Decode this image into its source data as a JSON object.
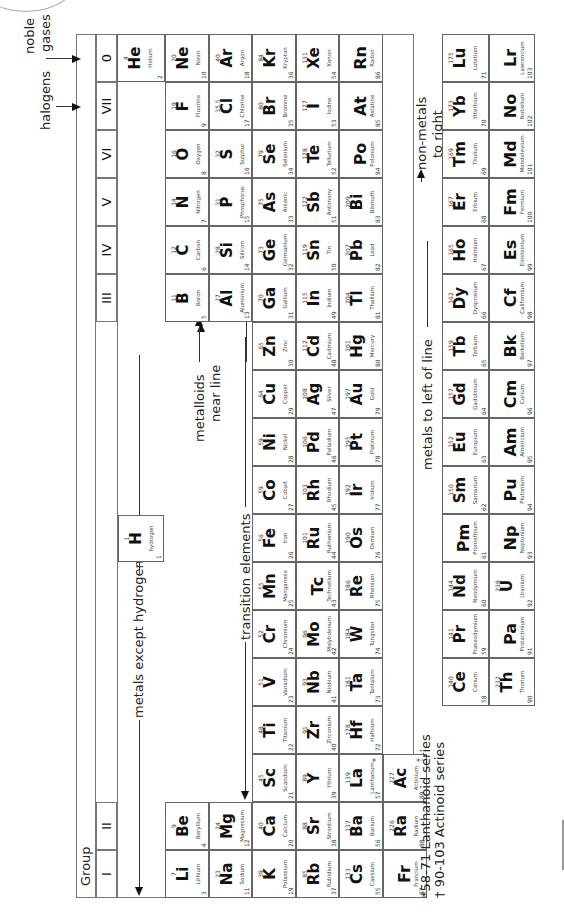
{
  "group_header": {
    "label": "Group",
    "groups": [
      "I",
      "II",
      "III",
      "IV",
      "V",
      "VI",
      "VII",
      "0"
    ]
  },
  "labels": {
    "noble_gases": [
      "noble",
      "gases"
    ],
    "halogens": "halogens",
    "metals_except_hydrogen": "metals except hydrogen",
    "non_metals": "non-metals",
    "transition_elements": "transition elements",
    "metalloids": [
      "metalloids",
      "near line"
    ],
    "metals_left": "metals to left of line",
    "non_metals_right": [
      "non-metals",
      "to right"
    ],
    "lanthanoid_note": "*58-71 Lanthanoid series",
    "actinoid_note": "† 90-103 Actinoid series"
  },
  "hydrogen": {
    "mass": "1",
    "symbol": "H",
    "name": "hydrogen",
    "number": "1"
  },
  "periods": [
    {
      "period": 2,
      "elements": [
        {
          "g": 0,
          "mass": "7",
          "symbol": "Li",
          "name": "Lithium",
          "number": "3"
        },
        {
          "g": 1,
          "mass": "9",
          "symbol": "Be",
          "name": "Beryllium",
          "number": "4"
        },
        {
          "g": 12,
          "mass": "11",
          "symbol": "B",
          "name": "Boron",
          "number": "5"
        },
        {
          "g": 13,
          "mass": "12",
          "symbol": "C",
          "name": "Carbon",
          "number": "6"
        },
        {
          "g": 14,
          "mass": "14",
          "symbol": "N",
          "name": "Nitrogen",
          "number": "7"
        },
        {
          "g": 15,
          "mass": "16",
          "symbol": "O",
          "name": "Oxygen",
          "number": "8"
        },
        {
          "g": 16,
          "mass": "19",
          "symbol": "F",
          "name": "Fluorine",
          "number": "9"
        },
        {
          "g": 17,
          "mass": "20",
          "symbol": "Ne",
          "name": "Neon",
          "number": "10"
        }
      ]
    },
    {
      "period": 3,
      "elements": [
        {
          "g": 0,
          "mass": "23",
          "symbol": "Na",
          "name": "Sodium",
          "number": "11"
        },
        {
          "g": 1,
          "mass": "24",
          "symbol": "Mg",
          "name": "Magnesium",
          "number": "12"
        },
        {
          "g": 12,
          "mass": "27",
          "symbol": "Al",
          "name": "Aluminium",
          "number": "13"
        },
        {
          "g": 13,
          "mass": "28",
          "symbol": "Si",
          "name": "Silicon",
          "number": "14"
        },
        {
          "g": 14,
          "mass": "31",
          "symbol": "P",
          "name": "Phosphorus",
          "number": "15"
        },
        {
          "g": 15,
          "mass": "32",
          "symbol": "S",
          "name": "Sulphur",
          "number": "16"
        },
        {
          "g": 16,
          "mass": "35.5",
          "symbol": "Cl",
          "name": "Chlorine",
          "number": "17"
        },
        {
          "g": 17,
          "mass": "40",
          "symbol": "Ar",
          "name": "Argon",
          "number": "18"
        }
      ]
    },
    {
      "period": 4,
      "elements": [
        {
          "g": 0,
          "mass": "39",
          "symbol": "K",
          "name": "Potassium",
          "number": "19"
        },
        {
          "g": 1,
          "mass": "40",
          "symbol": "Ca",
          "name": "Calcium",
          "number": "20"
        },
        {
          "g": 2,
          "mass": "45",
          "symbol": "Sc",
          "name": "Scandium",
          "number": "21"
        },
        {
          "g": 3,
          "mass": "48",
          "symbol": "Ti",
          "name": "Titanium",
          "number": "22"
        },
        {
          "g": 4,
          "mass": "51",
          "symbol": "V",
          "name": "Vanadium",
          "number": "23"
        },
        {
          "g": 5,
          "mass": "52",
          "symbol": "Cr",
          "name": "Chromium",
          "number": "24"
        },
        {
          "g": 6,
          "mass": "55",
          "symbol": "Mn",
          "name": "Manganese",
          "number": "25"
        },
        {
          "g": 7,
          "mass": "56",
          "symbol": "Fe",
          "name": "Iron",
          "number": "26"
        },
        {
          "g": 8,
          "mass": "59",
          "symbol": "Co",
          "name": "Cobalt",
          "number": "27"
        },
        {
          "g": 9,
          "mass": "59",
          "symbol": "Ni",
          "name": "Nickel",
          "number": "28"
        },
        {
          "g": 10,
          "mass": "64",
          "symbol": "Cu",
          "name": "Copper",
          "number": "29"
        },
        {
          "g": 11,
          "mass": "65",
          "symbol": "Zn",
          "name": "Zinc",
          "number": "30"
        },
        {
          "g": 12,
          "mass": "70",
          "symbol": "Ga",
          "name": "Gallium",
          "number": "31"
        },
        {
          "g": 13,
          "mass": "73",
          "symbol": "Ge",
          "name": "Germanium",
          "number": "32"
        },
        {
          "g": 14,
          "mass": "75",
          "symbol": "As",
          "name": "Arsenic",
          "number": "33"
        },
        {
          "g": 15,
          "mass": "79",
          "symbol": "Se",
          "name": "Selenium",
          "number": "34"
        },
        {
          "g": 16,
          "mass": "80",
          "symbol": "Br",
          "name": "Bromine",
          "number": "35"
        },
        {
          "g": 17,
          "mass": "84",
          "symbol": "Kr",
          "name": "Krypton",
          "number": "36"
        }
      ]
    },
    {
      "period": 5,
      "elements": [
        {
          "g": 0,
          "mass": "85",
          "symbol": "Rb",
          "name": "Rubidium",
          "number": "37"
        },
        {
          "g": 1,
          "mass": "88",
          "symbol": "Sr",
          "name": "Strontium",
          "number": "38"
        },
        {
          "g": 2,
          "mass": "89",
          "symbol": "Y",
          "name": "Yttrium",
          "number": "39"
        },
        {
          "g": 3,
          "mass": "91",
          "symbol": "Zr",
          "name": "Zirconium",
          "number": "40"
        },
        {
          "g": 4,
          "mass": "93",
          "symbol": "Nb",
          "name": "Niobium",
          "number": "41"
        },
        {
          "g": 5,
          "mass": "96",
          "symbol": "Mo",
          "name": "Molybdenum",
          "number": "42"
        },
        {
          "g": 6,
          "mass": "",
          "symbol": "Tc",
          "name": "Technetium",
          "number": "43"
        },
        {
          "g": 7,
          "mass": "101",
          "symbol": "Ru",
          "name": "Ruthenium",
          "number": "44"
        },
        {
          "g": 8,
          "mass": "103",
          "symbol": "Rh",
          "name": "Rhodium",
          "number": "45"
        },
        {
          "g": 9,
          "mass": "106",
          "symbol": "Pd",
          "name": "Palladium",
          "number": "46"
        },
        {
          "g": 10,
          "mass": "108",
          "symbol": "Ag",
          "name": "Silver",
          "number": "47"
        },
        {
          "g": 11,
          "mass": "112",
          "symbol": "Cd",
          "name": "Cadmium",
          "number": "48"
        },
        {
          "g": 12,
          "mass": "115",
          "symbol": "In",
          "name": "Indium",
          "number": "49"
        },
        {
          "g": 13,
          "mass": "119",
          "symbol": "Sn",
          "name": "Tin",
          "number": "50"
        },
        {
          "g": 14,
          "mass": "122",
          "symbol": "Sb",
          "name": "Antimony",
          "number": "51"
        },
        {
          "g": 15,
          "mass": "128",
          "symbol": "Te",
          "name": "Tellurium",
          "number": "52"
        },
        {
          "g": 16,
          "mass": "127",
          "symbol": "I",
          "name": "Iodine",
          "number": "53"
        },
        {
          "g": 17,
          "mass": "131",
          "symbol": "Xe",
          "name": "Xenon",
          "number": "54"
        }
      ]
    },
    {
      "period": 6,
      "elements": [
        {
          "g": 0,
          "mass": "133",
          "symbol": "Cs",
          "name": "Caesium",
          "number": "55"
        },
        {
          "g": 1,
          "mass": "137",
          "symbol": "Ba",
          "name": "Barium",
          "number": "56"
        },
        {
          "g": 2,
          "mass": "139",
          "symbol": "La",
          "name": "Lanthanum",
          "number": "57",
          "mark": "*"
        },
        {
          "g": 3,
          "mass": "178",
          "symbol": "Hf",
          "name": "Hafnium",
          "number": "72"
        },
        {
          "g": 4,
          "mass": "181",
          "symbol": "Ta",
          "name": "Tantalum",
          "number": "73"
        },
        {
          "g": 5,
          "mass": "184",
          "symbol": "W",
          "name": "Tungsten",
          "number": "74"
        },
        {
          "g": 6,
          "mass": "186",
          "symbol": "Re",
          "name": "Rhenium",
          "number": "75"
        },
        {
          "g": 7,
          "mass": "190",
          "symbol": "Os",
          "name": "Osmium",
          "number": "76"
        },
        {
          "g": 8,
          "mass": "192",
          "symbol": "Ir",
          "name": "Iridium",
          "number": "77"
        },
        {
          "g": 9,
          "mass": "195",
          "symbol": "Pt",
          "name": "Platinum",
          "number": "78"
        },
        {
          "g": 10,
          "mass": "197",
          "symbol": "Au",
          "name": "Gold",
          "number": "79"
        },
        {
          "g": 11,
          "mass": "201",
          "symbol": "Hg",
          "name": "Mercury",
          "number": "80"
        },
        {
          "g": 12,
          "mass": "204",
          "symbol": "Tl",
          "name": "Thallium",
          "number": "81"
        },
        {
          "g": 13,
          "mass": "207",
          "symbol": "Pb",
          "name": "Lead",
          "number": "82"
        },
        {
          "g": 14,
          "mass": "209",
          "symbol": "Bi",
          "name": "Bismuth",
          "number": "83"
        },
        {
          "g": 15,
          "mass": "",
          "symbol": "Po",
          "name": "Polonium",
          "number": "84"
        },
        {
          "g": 16,
          "mass": "",
          "symbol": "At",
          "name": "Astatine",
          "number": "85"
        },
        {
          "g": 17,
          "mass": "",
          "symbol": "Rn",
          "name": "Radon",
          "number": "86"
        }
      ]
    },
    {
      "period": 7,
      "elements": [
        {
          "g": 0,
          "mass": "",
          "symbol": "Fr",
          "name": "Francium",
          "number": "87"
        },
        {
          "g": 1,
          "mass": "226",
          "symbol": "Ra",
          "name": "Radium",
          "number": "88"
        },
        {
          "g": 2,
          "mass": "227",
          "symbol": "Ac",
          "name": "Actinium",
          "number": "89",
          "mark": "†"
        }
      ]
    }
  ],
  "helium": {
    "mass": "4",
    "symbol": "He",
    "name": "Helium",
    "number": "2"
  },
  "lanthanoids": [
    {
      "mass": "140",
      "symbol": "Ce",
      "name": "Cerium",
      "number": "58"
    },
    {
      "mass": "141",
      "symbol": "Pr",
      "name": "Praseodymium",
      "number": "59"
    },
    {
      "mass": "144",
      "symbol": "Nd",
      "name": "Neodymium",
      "number": "60"
    },
    {
      "mass": "",
      "symbol": "Pm",
      "name": "Promethium",
      "number": "61"
    },
    {
      "mass": "150",
      "symbol": "Sm",
      "name": "Samarium",
      "number": "62"
    },
    {
      "mass": "152",
      "symbol": "Eu",
      "name": "Europium",
      "number": "63"
    },
    {
      "mass": "157",
      "symbol": "Gd",
      "name": "Gadolinium",
      "number": "64"
    },
    {
      "mass": "159",
      "symbol": "Tb",
      "name": "Terbium",
      "number": "65"
    },
    {
      "mass": "162",
      "symbol": "Dy",
      "name": "Dysprosium",
      "number": "66"
    },
    {
      "mass": "165",
      "symbol": "Ho",
      "name": "Holmium",
      "number": "67"
    },
    {
      "mass": "167",
      "symbol": "Er",
      "name": "Erbium",
      "number": "68"
    },
    {
      "mass": "169",
      "symbol": "Tm",
      "name": "Thulium",
      "number": "69"
    },
    {
      "mass": "173",
      "symbol": "Yb",
      "name": "Ytterbium",
      "number": "70"
    },
    {
      "mass": "175",
      "symbol": "Lu",
      "name": "Lutetium",
      "number": "71"
    }
  ],
  "actinoids": [
    {
      "mass": "232",
      "symbol": "Th",
      "name": "Thorium",
      "number": "90"
    },
    {
      "mass": "",
      "symbol": "Pa",
      "name": "Protactinium",
      "number": "91"
    },
    {
      "mass": "238",
      "symbol": "U",
      "name": "Uranium",
      "number": "92"
    },
    {
      "mass": "",
      "symbol": "Np",
      "name": "Neptunium",
      "number": "93"
    },
    {
      "mass": "",
      "symbol": "Pu",
      "name": "Plutonium",
      "number": "94"
    },
    {
      "mass": "",
      "symbol": "Am",
      "name": "Americium",
      "number": "95"
    },
    {
      "mass": "",
      "symbol": "Cm",
      "name": "Curium",
      "number": "96"
    },
    {
      "mass": "",
      "symbol": "Bk",
      "name": "Berkelium",
      "number": "97"
    },
    {
      "mass": "",
      "symbol": "Cf",
      "name": "Californium",
      "number": "98"
    },
    {
      "mass": "",
      "symbol": "Es",
      "name": "Einsteinium",
      "number": "99"
    },
    {
      "mass": "",
      "symbol": "Fm",
      "name": "Fermium",
      "number": "100"
    },
    {
      "mass": "",
      "symbol": "Md",
      "name": "Mendelevium",
      "number": "101"
    },
    {
      "mass": "",
      "symbol": "No",
      "name": "Nobelium",
      "number": "102"
    },
    {
      "mass": "",
      "symbol": "Lr",
      "name": "Lawrencium",
      "number": "103"
    }
  ]
}
